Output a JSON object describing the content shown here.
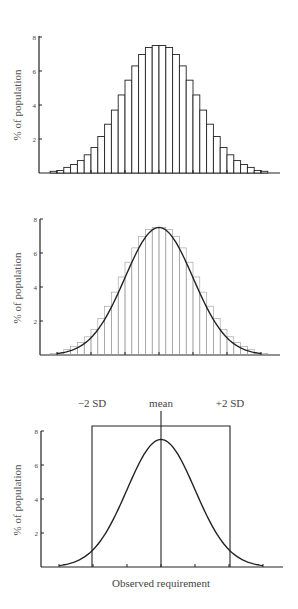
{
  "chart_data": [
    {
      "type": "bar",
      "title": "",
      "xlabel": "",
      "ylabel": "% of population",
      "ylim": [
        0,
        8
      ],
      "yticks": [
        2,
        4,
        6,
        8
      ],
      "grid": false,
      "categories": [
        "1",
        "2",
        "3",
        "4",
        "5",
        "6",
        "7",
        "8",
        "9",
        "10",
        "11",
        "12",
        "13",
        "14",
        "15",
        "16",
        "17",
        "18",
        "19",
        "20",
        "21",
        "22",
        "23",
        "24",
        "25",
        "26",
        "27",
        "28",
        "29",
        "30",
        "31",
        "32"
      ],
      "values": [
        0.1,
        0.15,
        0.33,
        0.5,
        0.73,
        1.07,
        1.5,
        2.15,
        2.87,
        3.7,
        4.59,
        5.46,
        6.3,
        6.97,
        7.38,
        7.5,
        7.5,
        7.38,
        6.97,
        6.3,
        5.46,
        4.59,
        3.7,
        2.87,
        2.15,
        1.5,
        1.07,
        0.73,
        0.5,
        0.33,
        0.15,
        0.1
      ]
    },
    {
      "type": "bar",
      "title": "",
      "xlabel": "",
      "ylabel": "% of population",
      "ylim": [
        0,
        8
      ],
      "yticks": [
        2,
        4,
        6,
        8
      ],
      "grid": false,
      "categories": [
        "1",
        "2",
        "3",
        "4",
        "5",
        "6",
        "7",
        "8",
        "9",
        "10",
        "11",
        "12",
        "13",
        "14",
        "15",
        "16",
        "17",
        "18",
        "19",
        "20",
        "21",
        "22",
        "23",
        "24",
        "25",
        "26",
        "27",
        "28",
        "29",
        "30",
        "31",
        "32"
      ],
      "values": [
        0.1,
        0.15,
        0.33,
        0.5,
        0.73,
        1.07,
        1.5,
        2.15,
        2.87,
        3.7,
        4.59,
        5.46,
        6.3,
        6.97,
        7.38,
        7.5,
        7.5,
        7.38,
        6.97,
        6.3,
        5.46,
        4.59,
        3.7,
        2.87,
        2.15,
        1.5,
        1.07,
        0.73,
        0.5,
        0.33,
        0.15,
        0.1
      ],
      "overlay": {
        "type": "line",
        "name": "normal curve",
        "peak": 7.5,
        "mean_sd_units": 0,
        "sd_range": [
          -3,
          3
        ]
      }
    },
    {
      "type": "line",
      "title": "",
      "xlabel": "Observed requirement",
      "ylabel": "% of population",
      "ylim": [
        0,
        8
      ],
      "yticks": [
        2,
        4,
        6,
        8
      ],
      "grid": false,
      "x": [
        -3,
        -2.5,
        -2,
        -1.5,
        -1,
        -0.5,
        0,
        0.5,
        1,
        1.5,
        2,
        2.5,
        3
      ],
      "values": [
        0.08,
        0.33,
        1.02,
        2.43,
        4.55,
        6.62,
        7.5,
        6.62,
        4.55,
        2.43,
        1.02,
        0.33,
        0.08
      ],
      "annotations": [
        {
          "label": "−2 SD",
          "x": -2
        },
        {
          "label": "mean",
          "x": 0
        },
        {
          "label": "+2 SD",
          "x": 2
        }
      ]
    }
  ],
  "labels": {
    "ylabel": "% of population",
    "xlabel": "Observed requirement",
    "yticks": [
      "2",
      "4",
      "6",
      "8"
    ],
    "minus2sd": "−2 SD",
    "mean": "mean",
    "plus2sd": "+2 SD"
  }
}
